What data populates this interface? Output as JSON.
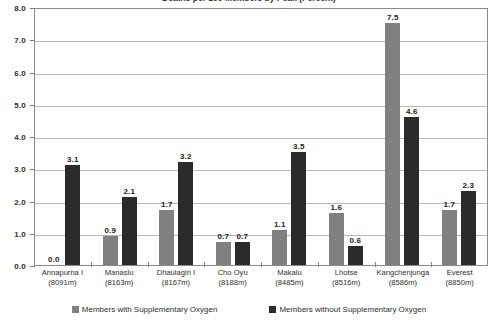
{
  "chart_data": {
    "type": "bar",
    "title": "Deaths per 100 Members by Peak (Percent)",
    "xlabel": "",
    "ylabel": "",
    "ylim": [
      0.0,
      8.0
    ],
    "ytick_labels": [
      "8.0",
      "7.0",
      "6.0",
      "5.0",
      "4.0",
      "3.0",
      "2.0",
      "1.0",
      "0.0"
    ],
    "ytick_values": [
      8.0,
      7.0,
      6.0,
      5.0,
      4.0,
      3.0,
      2.0,
      1.0,
      0.0
    ],
    "grid": true,
    "legend_position": "bottom",
    "categories": [
      "Annapurna I\n(8091m)",
      "Manaslu\n(8163m)",
      "Dhaulagiri I\n(8167m)",
      "Cho Oyu\n(8188m)",
      "Makalu\n(8485m)",
      "Lhotse\n(8516m)",
      "Kangchenjunga\n(8586m)",
      "Everest\n(8850m)"
    ],
    "category_names": [
      "Annapurna I",
      "Manaslu",
      "Dhaulagiri I",
      "Cho Oyu",
      "Makalu",
      "Lhotse",
      "Kangchenjunga",
      "Everest"
    ],
    "category_elevations": [
      "(8091m)",
      "(8163m)",
      "(8167m)",
      "(8188m)",
      "(8485m)",
      "(8516m)",
      "(8586m)",
      "(8850m)"
    ],
    "series": [
      {
        "name": "Members with Supplementary Oxygen",
        "color": "#808080",
        "values": [
          0.0,
          0.9,
          1.7,
          0.7,
          1.1,
          1.6,
          7.5,
          1.7
        ],
        "labels": [
          "0.0",
          "0.9",
          "1.7",
          "0.7",
          "1.1",
          "1.6",
          "7.5",
          "1.7"
        ]
      },
      {
        "name": "Members without Supplementary Oxygen",
        "color": "#2b2b2b",
        "values": [
          3.1,
          2.1,
          3.2,
          0.7,
          3.5,
          0.6,
          4.6,
          2.3
        ],
        "labels": [
          "3.1",
          "2.1",
          "3.2",
          "0.7",
          "3.5",
          "0.6",
          "4.6",
          "2.3"
        ]
      }
    ]
  }
}
